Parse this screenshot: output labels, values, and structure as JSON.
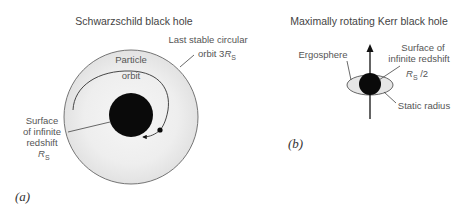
{
  "colors": {
    "ink": "#111111",
    "outline": "#666666",
    "region_fill": "#ececec",
    "label_text": "#555555"
  },
  "panel_a": {
    "tag": "(a)",
    "title": "Schwarzschild black hole",
    "labels": {
      "last_stable_line1": "Last stable circular",
      "last_stable_line2_prefix": "orbit  3",
      "radius_symbol": "R",
      "radius_subscript": "S",
      "particle_line1": "Particle",
      "particle_line2": "orbit",
      "surface_line1": "Surface",
      "surface_line2": "of infinite",
      "surface_line3": "redshift"
    },
    "geometry": {
      "outer_circle": {
        "cx": 131,
        "cy": 117,
        "r": 67,
        "meaning": "Last stable circular orbit 3R_S"
      },
      "horizon_disc": {
        "cx": 131,
        "cy": 115,
        "r": 22,
        "meaning": "Surface of infinite redshift R_S"
      },
      "particle": {
        "cx": 160,
        "cy": 130,
        "r": 2.6
      }
    }
  },
  "panel_b": {
    "tag": "(b)",
    "title": "Maximally rotating Kerr black hole",
    "labels": {
      "ergosphere": "Ergosphere",
      "surface_line1": "Surface of",
      "surface_line2": "infinite  redshift",
      "radius_symbol": "R",
      "radius_subscript": "S",
      "radius_suffix": " /2",
      "static_radius": "Static radius"
    },
    "geometry": {
      "rotation_axis": {
        "x": 370,
        "y_top": 45,
        "y_bottom": 119
      },
      "ergosphere_ellipse": {
        "cx": 370,
        "cy": 85,
        "rx": 23,
        "ry": 10
      },
      "horizon_disc": {
        "cx": 370,
        "cy": 84,
        "r": 11
      }
    }
  }
}
